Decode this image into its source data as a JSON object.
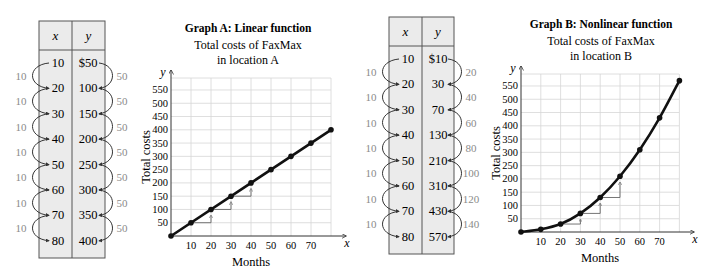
{
  "colors": {
    "table_bg": "#ebebeb",
    "table_border": "#555555",
    "diff_label": "#8a8a8a",
    "grid": "#d6d6d6",
    "curve": "#111111",
    "step": "#666666"
  },
  "tables": [
    {
      "name": "table-a",
      "header": {
        "x": "x",
        "y": "y"
      },
      "x_values": [
        "10",
        "20",
        "30",
        "40",
        "50",
        "60",
        "70",
        "80"
      ],
      "y_values": [
        "$50",
        "100",
        "150",
        "200",
        "250",
        "300",
        "350",
        "400"
      ],
      "x_diffs": [
        "10",
        "10",
        "10",
        "10",
        "10",
        "10",
        "10"
      ],
      "y_diffs": [
        "50",
        "50",
        "50",
        "50",
        "50",
        "50",
        "50"
      ]
    },
    {
      "name": "table-b",
      "header": {
        "x": "x",
        "y": "y"
      },
      "x_values": [
        "10",
        "20",
        "30",
        "40",
        "50",
        "60",
        "70",
        "80"
      ],
      "y_values": [
        "$10",
        "30",
        "70",
        "130",
        "210",
        "310",
        "430",
        "570"
      ],
      "x_diffs": [
        "10",
        "10",
        "10",
        "10",
        "10",
        "10",
        "10"
      ],
      "y_diffs": [
        "20",
        "40",
        "60",
        "80",
        "100",
        "120",
        "140"
      ]
    }
  ],
  "graphs": [
    {
      "title": "Graph A:  Linear function",
      "subtitle_line1": "Total costs of FaxMax",
      "subtitle_line2": "in location A",
      "xlabel": "Months",
      "ylabel": "Total costs",
      "x_axis_letter": "x",
      "y_axis_letter": "y"
    },
    {
      "title": "Graph B:  Nonlinear function",
      "subtitle_line1": "Total costs of FaxMax",
      "subtitle_line2": "in location B",
      "xlabel": "Months",
      "ylabel": "Total costs",
      "x_axis_letter": "x",
      "y_axis_letter": "y"
    }
  ],
  "chart_data": [
    {
      "type": "line",
      "title": "Graph A: Linear function — Total costs of FaxMax in location A",
      "xlabel": "Months",
      "ylabel": "Total costs",
      "x_ticks": [
        10,
        20,
        30,
        40,
        50,
        60,
        70
      ],
      "y_ticks": [
        50,
        100,
        150,
        200,
        250,
        300,
        350,
        400,
        450,
        500,
        550
      ],
      "xlim": [
        0,
        80
      ],
      "ylim": [
        0,
        600
      ],
      "grid": true,
      "legend": null,
      "series": [
        {
          "name": "Location A",
          "x": [
            0,
            10,
            20,
            30,
            40,
            50,
            60,
            70,
            80
          ],
          "values": [
            0,
            50,
            100,
            150,
            200,
            250,
            300,
            350,
            400
          ]
        }
      ],
      "annotations": "Step triangles at x=10→20, 20→30, 30→40 showing rise of 50 per 10 months"
    },
    {
      "type": "line",
      "title": "Graph B: Nonlinear function — Total costs of FaxMax in location B",
      "xlabel": "Months",
      "ylabel": "Total costs",
      "x_ticks": [
        10,
        20,
        30,
        40,
        50,
        60,
        70
      ],
      "y_ticks": [
        50,
        100,
        150,
        200,
        250,
        300,
        350,
        400,
        450,
        500,
        550
      ],
      "xlim": [
        0,
        80
      ],
      "ylim": [
        0,
        600
      ],
      "grid": true,
      "legend": null,
      "series": [
        {
          "name": "Location B",
          "x": [
            0,
            10,
            20,
            30,
            40,
            50,
            60,
            70,
            80
          ],
          "values": [
            0,
            10,
            30,
            70,
            130,
            210,
            310,
            430,
            570
          ]
        }
      ],
      "annotations": "Step triangles at x=20→30, 30→40, 40→50 showing increasing rises"
    }
  ]
}
